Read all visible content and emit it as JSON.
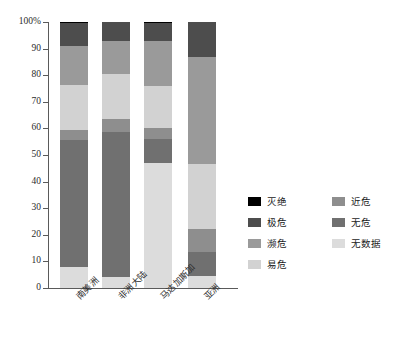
{
  "chart_data": {
    "type": "bar",
    "stacked": true,
    "normalized": "percent",
    "title": "",
    "subtitle": "",
    "xlabel": "",
    "ylabel": "",
    "grid": false,
    "legend_position": "right",
    "ylim": [
      0,
      100
    ],
    "ytick_labels": [
      "0",
      "10",
      "20",
      "30",
      "40",
      "50",
      "60",
      "70",
      "80",
      "90",
      "100%"
    ],
    "ytick_values": [
      0,
      10,
      20,
      30,
      40,
      50,
      60,
      70,
      80,
      90,
      100
    ],
    "categories": [
      "南美洲",
      "非洲大陆",
      "马达加斯加",
      "亚洲"
    ],
    "series": [
      {
        "name": "无数据",
        "color": "#dcdcdc",
        "values": [
          8.0,
          4.0,
          47.0,
          4.5
        ]
      },
      {
        "name": "无危",
        "color": "#707070",
        "values": [
          47.5,
          54.5,
          9.0,
          9.0
        ]
      },
      {
        "name": "近危",
        "color": "#8e8e8e",
        "values": [
          4.0,
          5.0,
          4.0,
          8.5
        ]
      },
      {
        "name": "易危",
        "color": "#d2d2d2",
        "values": [
          17.0,
          17.0,
          16.0,
          24.5
        ]
      },
      {
        "name": "濒危",
        "color": "#9a9a9a",
        "values": [
          14.5,
          12.5,
          17.0,
          40.5
        ]
      },
      {
        "name": "极危",
        "color": "#4d4d4d",
        "values": [
          8.5,
          7.0,
          6.5,
          13.0
        ]
      },
      {
        "name": "灭绝",
        "color": "#000000",
        "values": [
          0.5,
          0.0,
          0.5,
          0.0
        ]
      }
    ],
    "legend_order": [
      "灭绝",
      "极危",
      "濒危",
      "易危",
      "近危",
      "无危",
      "无数据"
    ],
    "legend_left_column": [
      "灭绝",
      "极危",
      "濒危",
      "易危"
    ],
    "legend_right_column": [
      "近危",
      "无危",
      "无数据"
    ]
  },
  "legend": {
    "items": [
      {
        "label": "灭绝",
        "color": "#000000"
      },
      {
        "label": "极危",
        "color": "#4d4d4d"
      },
      {
        "label": "濒危",
        "color": "#9a9a9a"
      },
      {
        "label": "易危",
        "color": "#d2d2d2"
      },
      {
        "label": "近危",
        "color": "#8e8e8e"
      },
      {
        "label": "无危",
        "color": "#707070"
      },
      {
        "label": "无数据",
        "color": "#dcdcdc"
      }
    ]
  },
  "colors": {
    "axis": "#5a5a5a",
    "text": "#1a1a1a",
    "background": "#ffffff"
  }
}
